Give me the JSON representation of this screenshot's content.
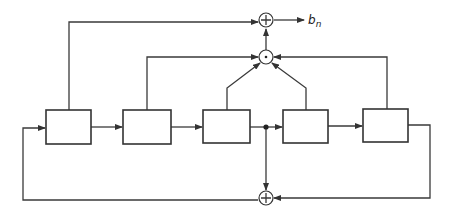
{
  "diagram": {
    "type": "shift-register-with-feedback",
    "registers": [
      {
        "id": "stage-1",
        "label": ""
      },
      {
        "id": "stage-2",
        "label": ""
      },
      {
        "id": "stage-3",
        "label": ""
      },
      {
        "id": "stage-4",
        "label": ""
      },
      {
        "id": "stage-5",
        "label": ""
      }
    ],
    "operators": {
      "output_xor": "+",
      "and_gate": "·",
      "feedback_xor": "+"
    },
    "output": {
      "label": "b",
      "subscript": "n"
    },
    "colors": {
      "line": "#3a3a3a",
      "background": "#ffffff"
    }
  }
}
